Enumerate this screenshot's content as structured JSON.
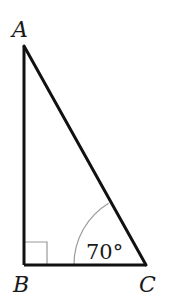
{
  "diagram": {
    "type": "right-triangle",
    "vertices": {
      "A": {
        "label": "A"
      },
      "B": {
        "label": "B"
      },
      "C": {
        "label": "C"
      }
    },
    "right_angle_at": "B",
    "angle_mark": {
      "vertex": "C",
      "label": "70°"
    },
    "colors": {
      "stroke": "#111111",
      "mark": "#999999",
      "background": "#ffffff"
    }
  }
}
